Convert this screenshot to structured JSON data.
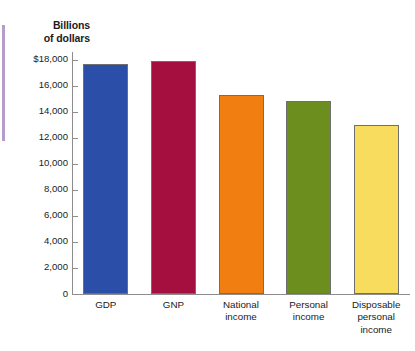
{
  "chart_data": {
    "type": "bar",
    "title": "",
    "subtitle": "",
    "xlabel": "",
    "ylabel": "Billions of dollars",
    "ylabel_lines": [
      "Billions",
      "of dollars"
    ],
    "categories": [
      "GDP",
      "GNP",
      "National income",
      "Personal income",
      "Disposable personal income"
    ],
    "category_label_lines": [
      [
        "GDP"
      ],
      [
        "GNP"
      ],
      [
        "National",
        "income"
      ],
      [
        "Personal",
        "income"
      ],
      [
        "Disposable",
        "personal",
        "income"
      ]
    ],
    "values": [
      17700,
      17900,
      15300,
      14800,
      13000
    ],
    "bar_colors": [
      "#2b4fa8",
      "#a50f40",
      "#f07e10",
      "#6b8e1e",
      "#f7dc5e"
    ],
    "ylim": [
      0,
      18600
    ],
    "ytick_values": [
      18000,
      16000,
      14000,
      12000,
      10000,
      8000,
      6000,
      4000,
      2000,
      0
    ],
    "ytick_labels": [
      "$18,000",
      "16,000",
      "14,000",
      "12,000",
      "10,000",
      "8,000",
      "6,000",
      "4,000",
      "2,000",
      "0"
    ],
    "grid": false,
    "legend": "none",
    "bar_border_color": "#6f6f6f",
    "axis_color": "#8d8d8d"
  },
  "artifacts": {
    "left_edge_line_color": "#a98bc0"
  }
}
